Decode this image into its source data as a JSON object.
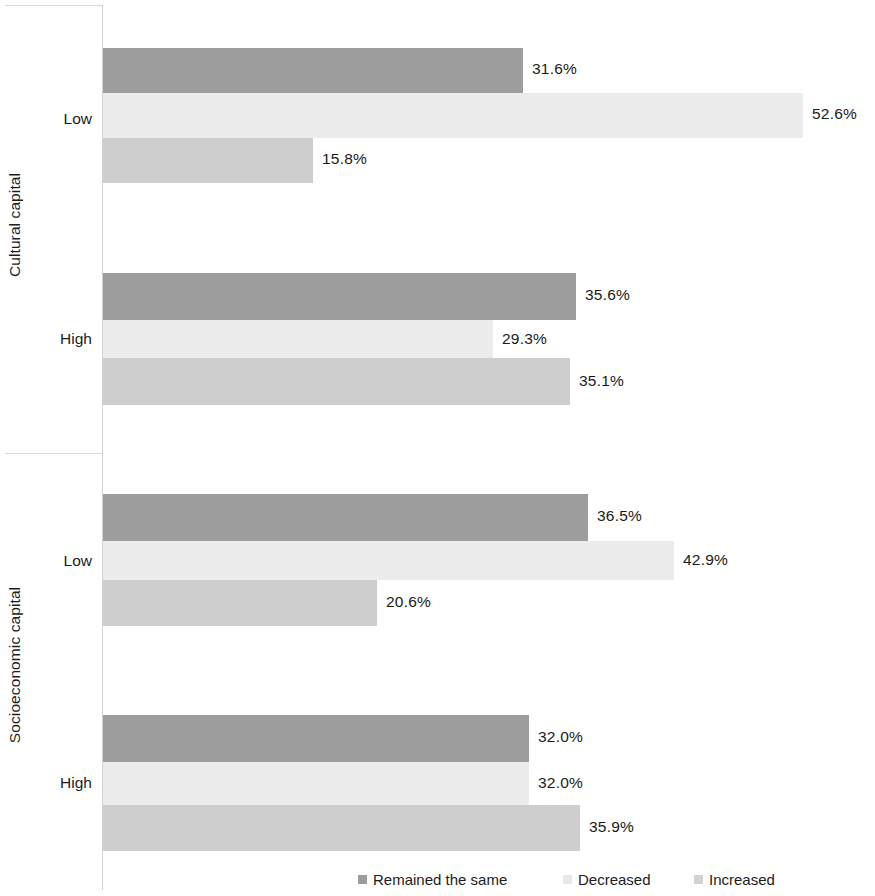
{
  "chart_data": {
    "type": "bar",
    "orientation": "horizontal",
    "title": "",
    "xlabel": "",
    "ylabel": "",
    "grid": false,
    "legend_position": "bottom",
    "xlim": [
      0,
      52.6
    ],
    "value_format": "percent",
    "series": [
      {
        "name": "Remained the same",
        "color": "#9d9d9d",
        "values": [
          31.6,
          35.6,
          36.5,
          32.0
        ],
        "labels": [
          "31.6%",
          "35.6%",
          "36.5%",
          "32.0%"
        ]
      },
      {
        "name": "Decreased",
        "color": "#ececec",
        "values": [
          52.6,
          29.3,
          42.9,
          32.0
        ],
        "labels": [
          "52.6%",
          "29.3%",
          "42.9%",
          "32.0%"
        ]
      },
      {
        "name": "Increased",
        "color": "#cecece",
        "values": [
          15.8,
          35.1,
          20.6,
          35.9
        ],
        "labels": [
          "15.8%",
          "35.1%",
          "20.6%",
          "35.9%"
        ]
      }
    ],
    "categories": [
      "Low",
      "High",
      "Low",
      "High"
    ],
    "group_titles": [
      "Cultural capital",
      "Socioeconomic capital"
    ],
    "groups": [
      {
        "axis_title": "Cultural capital",
        "categories": [
          {
            "label": "Low",
            "bars": [
              {
                "series": "Remained the same",
                "value": 31.6,
                "label": "31.6%"
              },
              {
                "series": "Decreased",
                "value": 52.6,
                "label": "52.6%"
              },
              {
                "series": "Increased",
                "value": 15.8,
                "label": "15.8%"
              }
            ]
          },
          {
            "label": "High",
            "bars": [
              {
                "series": "Remained the same",
                "value": 35.6,
                "label": "35.6%"
              },
              {
                "series": "Decreased",
                "value": 29.3,
                "label": "29.3%"
              },
              {
                "series": "Increased",
                "value": 35.1,
                "label": "35.1%"
              }
            ]
          }
        ]
      },
      {
        "axis_title": "Socioeconomic capital",
        "categories": [
          {
            "label": "Low",
            "bars": [
              {
                "series": "Remained the same",
                "value": 36.5,
                "label": "36.5%"
              },
              {
                "series": "Decreased",
                "value": 42.9,
                "label": "42.9%"
              },
              {
                "series": "Increased",
                "value": 20.6,
                "label": "20.6%"
              }
            ]
          },
          {
            "label": "High",
            "bars": [
              {
                "series": "Remained the same",
                "value": 32.0,
                "label": "32.0%"
              },
              {
                "series": "Decreased",
                "value": 32.0,
                "label": "32.0%"
              },
              {
                "series": "Increased",
                "value": 35.9,
                "label": "35.9%"
              }
            ]
          }
        ]
      }
    ]
  },
  "axis_titles": {
    "cultural": "Cultural capital",
    "socioeconomic": "Socioeconomic capital"
  },
  "category_labels": {
    "g0_low": "Low",
    "g0_high": "High",
    "g1_low": "Low",
    "g1_high": "High"
  },
  "legend": {
    "items": [
      {
        "label": "Remained the same",
        "color": "#9d9d9d"
      },
      {
        "label": "Decreased",
        "color": "#e8e8e8"
      },
      {
        "label": "Increased",
        "color": "#d2d2d2"
      }
    ]
  },
  "values": {
    "g0_s0": "31.6%",
    "g0_s1": "52.6%",
    "g0_s2": "15.8%",
    "g1_s0": "35.6%",
    "g1_s1": "29.3%",
    "g1_s2": "35.1%",
    "g2_s0": "36.5%",
    "g2_s1": "42.9%",
    "g2_s2": "20.6%",
    "g3_s0": "32.0%",
    "g3_s1": "32.0%",
    "g3_s2": "35.9%"
  },
  "colors": {
    "series_remained": "#9d9d9d",
    "series_decreased": "#ececec",
    "series_increased": "#cecece",
    "axis": "#d2d2d2",
    "text": "#1c1c1c",
    "background": "#ffffff"
  }
}
